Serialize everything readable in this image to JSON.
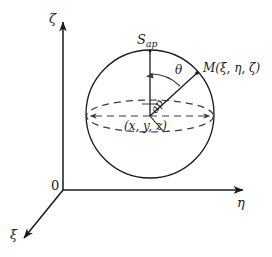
{
  "figure": {
    "type": "geometry-diagram",
    "background_color": "#ffffff",
    "stroke_color": "#1a1a1a",
    "text_color": "#1a1a1a"
  },
  "axes": {
    "origin_label": "0",
    "vertical": {
      "label": "ζ",
      "name": "zeta"
    },
    "horizontal": {
      "label": "η",
      "name": "eta"
    },
    "depth": {
      "label": "ξ",
      "name": "xi"
    }
  },
  "sphere": {
    "center_label_open": "(",
    "center_label": "x, y, z",
    "center_label_close": ")",
    "center_label_full": "(x, y, z)",
    "apex_label_base": "S",
    "apex_label_sub": "ap",
    "apex_label_full": "Sₐₚ",
    "equator_style": "dashed"
  },
  "point": {
    "label_base": "M",
    "label_args": "(ξ, η, ζ)",
    "label_full": "M(ξ, η, ζ)"
  },
  "angle": {
    "label": "θ",
    "name": "theta",
    "measured_from": "vertical-axis"
  },
  "radius": {
    "label": "ap",
    "name": "radius-segment"
  }
}
